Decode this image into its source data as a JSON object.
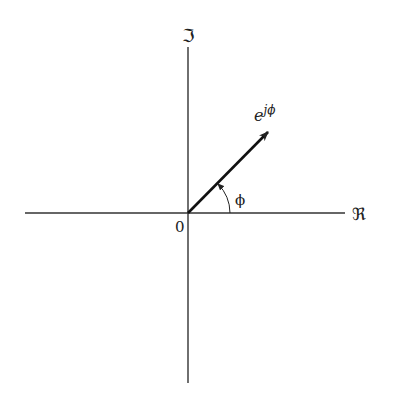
{
  "diagram": {
    "type": "complex-plane-phasor",
    "axes": {
      "imaginary_label": "ℑ",
      "real_label": "ℜ",
      "origin_label": "0"
    },
    "vector": {
      "label_base": "e",
      "label_exp": "jϕ",
      "angle_label": "ϕ"
    },
    "colors": {
      "ink": "#222222",
      "background": "#ffffff"
    }
  }
}
